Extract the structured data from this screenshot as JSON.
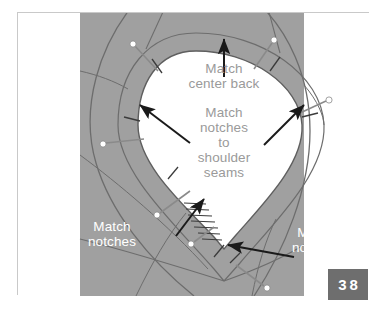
{
  "figure": {
    "kind": "sewing-instruction-diagram",
    "page_number": "38",
    "colors": {
      "fabric_gray": "#a0a0a0",
      "fabric_shadow_gray": "#999999",
      "inner_white": "#ffffff",
      "seam_line": "#6d6d6d",
      "arrow": "#1a1a1a",
      "inner_text": "#9a9a9a",
      "outer_text": "#ffffff",
      "badge_bg": "#6e6e6e",
      "badge_text": "#ffffff",
      "frame_border": "#c9c9c9",
      "page_bg": "#ffffff"
    }
  },
  "labels": {
    "center_back": "Match\ncenter back",
    "notches_to_shoulder": "Match\nnotches\nto\nshoulder\nseams",
    "notches_left": "Match\nnotches",
    "notches_right": "Match\nnotches"
  },
  "annotations": [
    {
      "name": "match-center-back",
      "text": "Match center back",
      "arrow": "points up to the top of the neckline opening",
      "color": "#9a9a9a"
    },
    {
      "name": "match-notches-to-shoulder-seams",
      "text": "Match notches to shoulder seams",
      "arrow": "two arrows pointing outward to the left and right shoulder seam notches",
      "color": "#9a9a9a"
    },
    {
      "name": "match-notches-left",
      "text": "Match notches",
      "arrow": "points up-right toward the clipped lower-left notch",
      "color": "#ffffff"
    },
    {
      "name": "match-notches-right",
      "text": "Match notches",
      "arrow": "points up-left toward the lower point of the opening",
      "color": "#ffffff"
    }
  ],
  "markers": {
    "pin_count": 8,
    "pin_head_color": "#ffffff",
    "pin_shaft_color": "#7a7a7a",
    "notch_marks": "short dark tick marks across the seam line",
    "clipped_edge": "row of short slash clips along the lower-left curve of the opening"
  },
  "badge": {
    "number": "38"
  }
}
